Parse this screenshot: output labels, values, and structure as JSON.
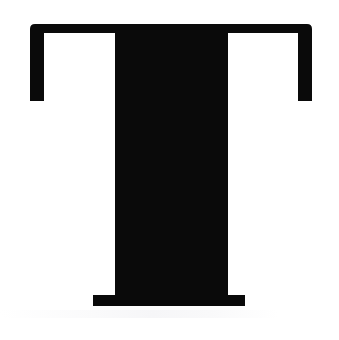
{
  "image": {
    "kind": "letterform-glyph",
    "character": "T",
    "description": "Uppercase serif letter T",
    "typeface_style": "slab serif",
    "case": "uppercase",
    "width_px": 339,
    "height_px": 340
  },
  "colors": {
    "glyph": "#0a0a0a",
    "background": "#ffffff"
  },
  "geometry": {
    "top_bar": {
      "left_px": 30,
      "right_px": 312,
      "top_px": 24,
      "bottom_px": 33,
      "corner_radius_px": 5
    },
    "stem": {
      "left_px": 115,
      "right_px": 223,
      "top_px": 33,
      "bottom_px": 295
    },
    "foot": {
      "left_px": 93,
      "right_px": 245,
      "top_px": 295,
      "bottom_px": 306
    },
    "left_serif_foot": {
      "left_px": 30,
      "right_px": 44,
      "bottom_px": 101
    },
    "right_serif_foot": {
      "left_px": 298,
      "right_px": 312,
      "bottom_px": 101
    },
    "cutout_apex_left_px": 112,
    "cutout_apex_right_px": 228
  },
  "glyph_path": "M 35 24 L 307 24 Q 312 24 312 29 L 312 101 L 298 101 L 298 33 L 228 33 L 228 295 L 245 295 L 245 306 L 93 306 L 93 295 L 115 295 L 115 33 L 44 33 L 44 101 L 30 101 L 30 29 Q 30 24 35 24 Z",
  "cutouts": [
    {
      "name": "left-counter-triangle",
      "points": "112,33 44,33 44,98"
    },
    {
      "name": "right-counter-triangle",
      "points": "231,33 298,33 298,98"
    }
  ],
  "accessibility": {
    "alt_text": "Large black uppercase serif letter T on a white background"
  }
}
